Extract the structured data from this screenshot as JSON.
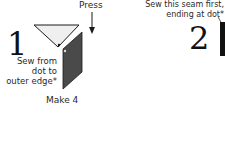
{
  "step1": {
    "number": "1",
    "press_label": "Press",
    "sew_instruction": [
      "Sew from",
      "dot to",
      "outer edge*"
    ],
    "quantity_label": "Make 4"
  },
  "step2": {
    "number": "2",
    "sew_instruction": [
      "Sew this seam first,",
      "ending at dot*"
    ]
  },
  "colors": {
    "triangle_fill": "#efefef",
    "parallelogram_fill": "#4a4a4a",
    "outline": "#1a1a1a",
    "text": "#2a2a2a"
  }
}
